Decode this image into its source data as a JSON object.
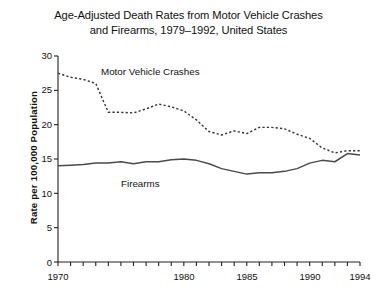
{
  "chart_data": {
    "type": "line",
    "title": "Age-Adjusted Death Rates from Motor Vehicle Crashes and Firearms, 1979–1992, United States",
    "title_lines": [
      "Age-Adjusted Death Rates from Motor Vehicle Crashes",
      "and Firearms, 1979–1992, United States"
    ],
    "xlabel": "",
    "ylabel": "Rate per 100,000 Population",
    "xlim": [
      1970,
      1994
    ],
    "ylim": [
      0,
      30
    ],
    "grid": false,
    "legend_position": "inline-annotation",
    "yticks": [
      0,
      5,
      10,
      15,
      20,
      25,
      30
    ],
    "ytick_labels": [
      "0",
      "5",
      "10",
      "15",
      "20",
      "25",
      "30"
    ],
    "xticks": [
      1970,
      1971,
      1972,
      1973,
      1974,
      1975,
      1976,
      1977,
      1978,
      1979,
      1980,
      1981,
      1982,
      1983,
      1984,
      1985,
      1986,
      1987,
      1988,
      1989,
      1990,
      1991,
      1992,
      1993,
      1994
    ],
    "xtick_labels_shown": [
      "1970",
      "1980",
      "1985",
      "1990",
      "1994"
    ],
    "xtick_labels_shown_at": [
      1970,
      1980,
      1985,
      1990,
      1994
    ],
    "x": [
      1970,
      1971,
      1972,
      1973,
      1974,
      1975,
      1976,
      1977,
      1978,
      1979,
      1980,
      1981,
      1982,
      1983,
      1984,
      1985,
      1986,
      1987,
      1988,
      1989,
      1990,
      1991,
      1992,
      1993,
      1994
    ],
    "series": [
      {
        "name": "Motor Vehicle Crashes",
        "style": "dashed",
        "color": "#333333",
        "label_x": 1977.6,
        "label_y": 25.6,
        "values": [
          27.5,
          26.9,
          26.6,
          26.0,
          21.8,
          21.8,
          21.7,
          22.3,
          23.0,
          22.6,
          22.0,
          20.7,
          19.0,
          18.5,
          19.1,
          18.7,
          19.6,
          19.6,
          19.4,
          18.6,
          18.0,
          16.6,
          15.9,
          16.2,
          16.2
        ]
      },
      {
        "name": "Firearms",
        "style": "solid",
        "color": "#4a4a4a",
        "label_x": 1979.0,
        "label_y": 13.2,
        "values": [
          14.0,
          14.1,
          14.2,
          14.4,
          14.4,
          14.6,
          14.3,
          14.6,
          14.6,
          14.9,
          15.0,
          14.8,
          14.3,
          13.6,
          13.2,
          12.8,
          13.0,
          13.0,
          13.2,
          13.6,
          14.4,
          14.8,
          14.6,
          15.8,
          15.6
        ]
      }
    ]
  }
}
